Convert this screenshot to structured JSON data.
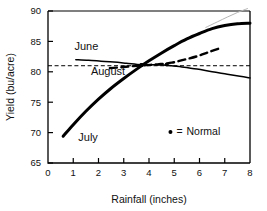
{
  "chart_data": {
    "type": "line",
    "title": "",
    "xlabel": "Rainfall (inches)",
    "ylabel": "Yield (bu/acre)",
    "xlim": [
      0,
      8
    ],
    "ylim": [
      65,
      90
    ],
    "xticks": [
      "0",
      "1",
      "2",
      "3",
      "4",
      "5",
      "6",
      "7",
      "8"
    ],
    "yticks": [
      "65",
      "70",
      "75",
      "80",
      "85",
      "90"
    ],
    "grid": false,
    "legend_position": "inside-lower-right",
    "legend": [
      {
        "marker": "dot",
        "separator": "=",
        "label": "Normal"
      }
    ],
    "reference_line": {
      "name": "normal-yield-reference",
      "value": 81,
      "style": "dashed",
      "orientation": "horizontal"
    },
    "series": [
      {
        "name": "June",
        "style": "solid-thin",
        "label": "June",
        "normal_point": {
          "x": 3.7,
          "y": 81.1
        },
        "points": [
          {
            "x": 1.1,
            "y": 82.0
          },
          {
            "x": 1.6,
            "y": 81.9
          },
          {
            "x": 2.1,
            "y": 81.75
          },
          {
            "x": 2.6,
            "y": 81.6
          },
          {
            "x": 3.1,
            "y": 81.4
          },
          {
            "x": 3.7,
            "y": 81.15
          },
          {
            "x": 4.3,
            "y": 81.15
          },
          {
            "x": 4.8,
            "y": 81.05
          },
          {
            "x": 5.3,
            "y": 80.8
          },
          {
            "x": 5.9,
            "y": 80.45
          },
          {
            "x": 6.5,
            "y": 80.0
          },
          {
            "x": 7.1,
            "y": 79.6
          },
          {
            "x": 7.6,
            "y": 79.25
          },
          {
            "x": 8.0,
            "y": 79.0
          }
        ]
      },
      {
        "name": "July",
        "style": "solid-thick",
        "label": "July",
        "normal_point": {
          "x": 3.7,
          "y": 81.1
        },
        "points": [
          {
            "x": 0.6,
            "y": 69.4
          },
          {
            "x": 1.0,
            "y": 71.3
          },
          {
            "x": 1.5,
            "y": 73.5
          },
          {
            "x": 2.0,
            "y": 75.5
          },
          {
            "x": 2.5,
            "y": 77.3
          },
          {
            "x": 3.0,
            "y": 78.9
          },
          {
            "x": 3.5,
            "y": 80.4
          },
          {
            "x": 4.0,
            "y": 81.8
          },
          {
            "x": 4.5,
            "y": 83.1
          },
          {
            "x": 5.0,
            "y": 84.3
          },
          {
            "x": 5.5,
            "y": 85.4
          },
          {
            "x": 6.0,
            "y": 86.3
          },
          {
            "x": 6.5,
            "y": 87.1
          },
          {
            "x": 7.0,
            "y": 87.6
          },
          {
            "x": 7.5,
            "y": 87.9
          },
          {
            "x": 8.0,
            "y": 88.0
          }
        ]
      },
      {
        "name": "August",
        "style": "dashed-thick",
        "label": "August",
        "normal_point": {
          "x": 4.7,
          "y": 81.2
        },
        "points": [
          {
            "x": 2.45,
            "y": 80.6
          },
          {
            "x": 2.9,
            "y": 80.75
          },
          {
            "x": 3.4,
            "y": 80.95
          },
          {
            "x": 3.9,
            "y": 81.1
          },
          {
            "x": 4.4,
            "y": 81.25
          },
          {
            "x": 4.9,
            "y": 81.5
          },
          {
            "x": 5.4,
            "y": 82.0
          },
          {
            "x": 5.9,
            "y": 82.55
          },
          {
            "x": 6.4,
            "y": 83.3
          },
          {
            "x": 6.9,
            "y": 84.0
          }
        ]
      },
      {
        "name": "June-extension",
        "style": "solid-faint",
        "label": "",
        "points": [
          {
            "x": 6.25,
            "y": 87.3
          },
          {
            "x": 6.7,
            "y": 88.2
          },
          {
            "x": 7.1,
            "y": 89.0
          },
          {
            "x": 7.5,
            "y": 89.75
          },
          {
            "x": 7.9,
            "y": 90.4
          }
        ]
      }
    ],
    "annotations": [
      {
        "text": "June",
        "x": 1.05,
        "y": 83.6
      },
      {
        "text": "August",
        "x": 1.7,
        "y": 79.4
      },
      {
        "text": "July",
        "x": 1.2,
        "y": 68.6
      }
    ],
    "colors": {
      "line": "#000000",
      "faint_line": "#b5b5b5",
      "axis": "#000000",
      "text": "#111111",
      "background": "#ffffff"
    }
  }
}
